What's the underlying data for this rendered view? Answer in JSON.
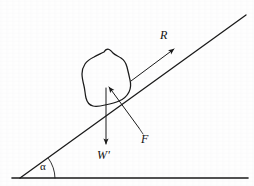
{
  "figure": {
    "background_color": "#fefefe",
    "stroke_color": "#1a1a1a",
    "width": 254,
    "height": 186
  },
  "labels": {
    "reaction": "R",
    "friction": "F",
    "weight": "Wʹ",
    "angle": "α"
  },
  "elements": {
    "incline_name": "inclined-plane-line",
    "ground_name": "horizontal-ground-line",
    "body_name": "irregular-block-outline",
    "angle_arc_name": "angle-arc",
    "reaction_vector_name": "reaction-force-vector",
    "friction_vector_name": "friction-force-vector",
    "weight_vector_name": "weight-force-vector",
    "friction_leader_name": "friction-label-leader-line"
  },
  "geometry": {
    "vertex": [
      20,
      178
    ],
    "incline_end": [
      246,
      15
    ],
    "ground_end": [
      248,
      178
    ],
    "incline_angle_deg": 36,
    "reaction_arrow": {
      "from": [
        131,
        81
      ],
      "to": [
        176,
        48
      ]
    },
    "weight_arrow": {
      "from": [
        106,
        88
      ],
      "to": [
        106,
        147
      ]
    },
    "friction_arrow": {
      "from": [
        139,
        129
      ],
      "to": [
        107,
        85
      ]
    }
  }
}
